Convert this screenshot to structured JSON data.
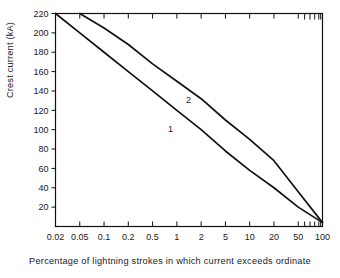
{
  "chart_data": {
    "type": "line",
    "title": "",
    "xlabel": "Percentage of lightning strokes in which current exceeds ordinate",
    "ylabel": "Crest current (kA)",
    "x_scale": "probability",
    "x_tick_labels": [
      "0.02",
      "0.05",
      "0.1",
      "0.2",
      "0.5",
      "1",
      "2",
      "5",
      "10",
      "20",
      "50",
      "100"
    ],
    "x_tick_values": [
      0.02,
      0.05,
      0.1,
      0.2,
      0.5,
      1,
      2,
      5,
      10,
      20,
      50,
      100
    ],
    "y_tick_labels": [
      "20",
      "40",
      "60",
      "80",
      "100",
      "120",
      "140",
      "160",
      "180",
      "200",
      "220"
    ],
    "y_tick_values": [
      20,
      40,
      60,
      80,
      100,
      120,
      140,
      160,
      180,
      200,
      220
    ],
    "ylim": [
      0,
      220
    ],
    "grid": false,
    "legend_position": "inline-annotations",
    "series": [
      {
        "name": "1",
        "label": "1",
        "color": "#111111",
        "annotation": "1",
        "x": [
          0.02,
          0.05,
          0.1,
          0.2,
          0.5,
          1,
          2,
          5,
          10,
          20,
          50,
          100
        ],
        "values": [
          220,
          200,
          180,
          160,
          140,
          120,
          100,
          78,
          58,
          40,
          20,
          4
        ]
      },
      {
        "name": "2",
        "label": "2",
        "color": "#111111",
        "annotation": "2",
        "x": [
          0.05,
          0.1,
          0.2,
          0.5,
          1,
          2,
          5,
          10,
          20,
          50,
          100
        ],
        "values": [
          220,
          205,
          188,
          168,
          150,
          132,
          110,
          90,
          68,
          36,
          4
        ]
      }
    ]
  },
  "axes": {
    "y_axis_title": "Crest current (kA)",
    "x_axis_title": "Percentage of lightning strokes in which current exceeds ordinate"
  },
  "annotations": {
    "curve_one": "1",
    "curve_two": "2"
  }
}
